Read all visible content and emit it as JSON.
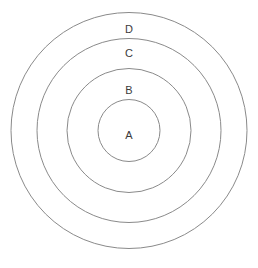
{
  "figure": {
    "type": "concentric-circles",
    "background_color": "#ffffff",
    "stroke_color": "#8a8a8a",
    "stroke_width": 1,
    "text_color": "#3b3b3b",
    "canvas": {
      "width": 258,
      "height": 268
    },
    "center": {
      "x": 129,
      "y": 130.5
    }
  },
  "chart_data": {
    "type": "diagram",
    "title": "",
    "xlabel": "",
    "ylabel": "",
    "categories": [
      "A",
      "B",
      "C",
      "D"
    ],
    "values": [
      62,
      126,
      185,
      237
    ],
    "series": [
      {
        "name": "circle diameter (px)",
        "values": [
          62,
          126,
          185,
          237
        ]
      },
      {
        "name": "circle radius (px)",
        "values": [
          31,
          63,
          92.5,
          118.5
        ]
      }
    ],
    "legend_position": "none",
    "grid": false
  },
  "circles": [
    {
      "id": "circle-d",
      "label": "D",
      "cx": 129,
      "cy": 130.5,
      "r": 118,
      "label_x": 129,
      "label_y": 29
    },
    {
      "id": "circle-c",
      "label": "C",
      "cx": 129,
      "cy": 130.5,
      "r": 92,
      "label_x": 129,
      "label_y": 53
    },
    {
      "id": "circle-b",
      "label": "B",
      "cx": 129,
      "cy": 130.5,
      "r": 62,
      "label_x": 129,
      "label_y": 90
    },
    {
      "id": "circle-a",
      "label": "A",
      "cx": 129,
      "cy": 130.5,
      "r": 31,
      "label_x": 129,
      "label_y": 135
    }
  ]
}
